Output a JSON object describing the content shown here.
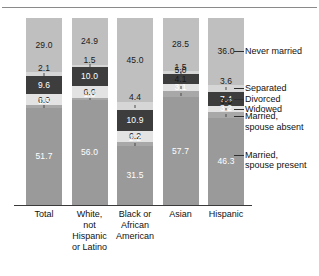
{
  "chart_data": {
    "type": "bar",
    "title": "",
    "subtitle": "",
    "xlabel": "",
    "ylabel": "",
    "ylim": [
      0,
      100
    ],
    "grid": false,
    "legend_position": "right-callouts",
    "stacked": true,
    "units": "percent",
    "categories": [
      "Total",
      "White,\nnot\nHispanic\nor Latino",
      "Black or\nAfrican\nAmerican",
      "Asian",
      "Hispanic"
    ],
    "series": [
      {
        "name": "Never married",
        "color": "#bfbfbf",
        "values": [
          29.0,
          24.9,
          45.0,
          28.5,
          36.0
        ]
      },
      {
        "name": "Separated",
        "color": "#d6d6d6",
        "values": [
          2.1,
          1.5,
          4.4,
          1.5,
          3.6
        ]
      },
      {
        "name": "Divorced",
        "color": "#3d3d3d",
        "values": [
          9.6,
          10.0,
          10.9,
          5.0,
          7.4
        ]
      },
      {
        "name": "Widowed",
        "color": "#e3e3e3",
        "values": [
          6.0,
          6.6,
          6.2,
          4.1,
          3.5
        ]
      },
      {
        "name": "Married,\nspouse absent",
        "color": "#a8a8a8",
        "values": [
          1.5,
          1.0,
          2.2,
          3.1,
          3.2
        ]
      },
      {
        "name": "Married,\nspouse present",
        "color": "#9a9a9a",
        "values": [
          51.7,
          56.0,
          31.5,
          57.7,
          46.3
        ]
      }
    ]
  },
  "axis": {
    "categories": [
      "Total",
      "White,\nnot\nHispanic\nor Latino",
      "Black or\nAfrican\nAmerican",
      "Asian",
      "Hispanic"
    ]
  },
  "legend": {
    "items": [
      {
        "label": "Never married"
      },
      {
        "label": "Separated"
      },
      {
        "label": "Divorced"
      },
      {
        "label": "Widowed"
      },
      {
        "label": "Married,\nspouse absent"
      },
      {
        "label": "Married,\nspouse present"
      }
    ]
  },
  "bars": [
    {
      "category": "Total",
      "segments": [
        {
          "series": "Never married",
          "value": "29.0"
        },
        {
          "series": "Separated",
          "value": "2.1"
        },
        {
          "series": "Divorced",
          "value": "9.6"
        },
        {
          "series": "Widowed",
          "value": "6.0"
        },
        {
          "series": "Married, spouse absent",
          "value": "1.5"
        },
        {
          "series": "Married, spouse present",
          "value": "51.7"
        }
      ]
    },
    {
      "category": "White, not Hispanic or Latino",
      "segments": [
        {
          "series": "Never married",
          "value": "24.9"
        },
        {
          "series": "Separated",
          "value": "1.5"
        },
        {
          "series": "Divorced",
          "value": "10.0"
        },
        {
          "series": "Widowed",
          "value": "6.6"
        },
        {
          "series": "Married, spouse absent",
          "value": "1.0"
        },
        {
          "series": "Married, spouse present",
          "value": "56.0"
        }
      ]
    },
    {
      "category": "Black or African American",
      "segments": [
        {
          "series": "Never married",
          "value": "45.0"
        },
        {
          "series": "Separated",
          "value": "4.4"
        },
        {
          "series": "Divorced",
          "value": "10.9"
        },
        {
          "series": "Widowed",
          "value": "6.2"
        },
        {
          "series": "Married, spouse absent",
          "value": "2.2"
        },
        {
          "series": "Married, spouse present",
          "value": "31.5"
        }
      ]
    },
    {
      "category": "Asian",
      "segments": [
        {
          "series": "Never married",
          "value": "28.5"
        },
        {
          "series": "Separated",
          "value": "1.5"
        },
        {
          "series": "Divorced",
          "value": "5.0"
        },
        {
          "series": "Widowed",
          "value": "4.1"
        },
        {
          "series": "Married, spouse absent",
          "value": "3.1"
        },
        {
          "series": "Married, spouse present",
          "value": "57.7"
        }
      ]
    },
    {
      "category": "Hispanic",
      "segments": [
        {
          "series": "Never married",
          "value": "36.0"
        },
        {
          "series": "Separated",
          "value": "3.6"
        },
        {
          "series": "Divorced",
          "value": "7.4"
        },
        {
          "series": "Widowed",
          "value": "3.5"
        },
        {
          "series": "Married, spouse absent",
          "value": "3.2"
        },
        {
          "series": "Married, spouse present",
          "value": "46.3"
        }
      ]
    }
  ]
}
